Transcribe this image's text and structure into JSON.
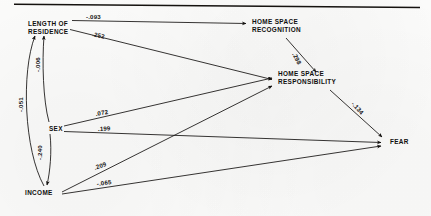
{
  "diagram": {
    "kind": "path-analysis-diagram",
    "title": "",
    "top_rule": true,
    "nodes": [
      {
        "id": "length_of_residence",
        "label_line1": "LENGTH OF",
        "label_line2": "RESIDENCE",
        "x": 28,
        "y": 26
      },
      {
        "id": "home_space_recognition",
        "label_line1": "HOME SPACE",
        "label_line2": "RECOGNITION",
        "x": 252,
        "y": 24
      },
      {
        "id": "home_space_responsibility",
        "label_line1": "HOME  SPACE",
        "label_line2": "RESPONSIBILITY",
        "x": 278,
        "y": 76
      },
      {
        "id": "sex",
        "label_line1": "SEX",
        "label_line2": "",
        "x": 49,
        "y": 129
      },
      {
        "id": "income",
        "label_line1": "INCOME",
        "label_line2": "",
        "x": 25,
        "y": 192
      },
      {
        "id": "fear",
        "label_line1": "FEAR",
        "label_line2": "",
        "x": 390,
        "y": 141
      }
    ],
    "paths": [
      {
        "id": "res_to_recognition",
        "from": "length_of_residence",
        "to": "home_space_recognition",
        "coefficient": "-.093",
        "label_x": 86,
        "label_y": 19,
        "rotation": 0
      },
      {
        "id": "res_to_responsibility",
        "from": "length_of_residence",
        "to": "home_space_responsibility",
        "coefficient": ".252",
        "label_x": 92,
        "label_y": 36,
        "rotation": 12
      },
      {
        "id": "recognition_to_responsibility",
        "from": "home_space_recognition",
        "to": "home_space_responsibility",
        "coefficient": ".298",
        "label_x": 292,
        "label_y": 54,
        "rotation": 62
      },
      {
        "id": "responsibility_to_fear",
        "from": "home_space_responsibility",
        "to": "fear",
        "coefficient": "-.134",
        "label_x": 351,
        "label_y": 104,
        "rotation": 48
      },
      {
        "id": "sex_to_responsibility",
        "from": "sex",
        "to": "home_space_responsibility",
        "coefficient": ".072",
        "label_x": 96,
        "label_y": 116,
        "rotation": -10
      },
      {
        "id": "sex_to_fear",
        "from": "sex",
        "to": "fear",
        "coefficient": ".199",
        "label_x": 98,
        "label_y": 131,
        "rotation": -3
      },
      {
        "id": "income_to_responsibility",
        "from": "income",
        "to": "home_space_responsibility",
        "coefficient": ".209",
        "label_x": 95,
        "label_y": 170,
        "rotation": -20
      },
      {
        "id": "income_to_fear",
        "from": "income",
        "to": "fear",
        "coefficient": "-.065",
        "label_x": 97,
        "label_y": 186,
        "rotation": -7
      },
      {
        "id": "sex_to_residence",
        "from": "sex",
        "to": "length_of_residence",
        "coefficient": "-.006",
        "label_x": 40,
        "label_y": 72,
        "rotation": -90
      },
      {
        "id": "income_to_residence",
        "from": "income",
        "to": "length_of_residence",
        "coefficient": "-.051",
        "label_x": 23,
        "label_y": 112,
        "rotation": -90
      },
      {
        "id": "sex_to_income",
        "from": "sex",
        "to": "income",
        "coefficient": "-.240",
        "label_x": 42,
        "label_y": 160,
        "rotation": -90
      }
    ]
  },
  "colors": {
    "ink": "#13110f",
    "paper": "#fdfdfc"
  }
}
